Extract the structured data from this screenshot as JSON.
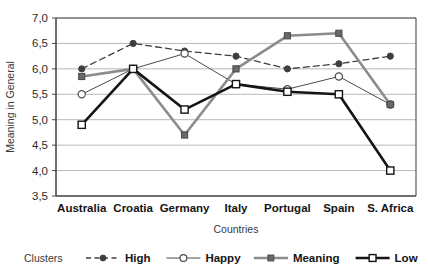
{
  "chart_data": {
    "type": "line",
    "title": "",
    "xlabel": "Countries",
    "ylabel": "Meaning in General",
    "categories": [
      "Australia",
      "Croatia",
      "Germany",
      "Italy",
      "Portugal",
      "Spain",
      "S. Africa"
    ],
    "ylim": [
      3.5,
      7.0
    ],
    "ytick_step": 0.5,
    "ytick_labels": [
      "7,0",
      "6,5",
      "6,0",
      "5,5",
      "5,0",
      "4,5",
      "4,0",
      "3,5"
    ],
    "ytick_values": [
      7.0,
      6.5,
      6.0,
      5.5,
      5.0,
      4.5,
      4.0,
      3.5
    ],
    "grid": true,
    "grid_axis": "y",
    "legend_position": "bottom",
    "legend_title": "Clusters",
    "series": [
      {
        "name": "High",
        "values": [
          6.0,
          6.5,
          6.35,
          6.25,
          6.0,
          6.1,
          6.25
        ],
        "marker": "filled-circle",
        "line_style": "dashed",
        "color": "#3f3f3f",
        "line_width": 1.3
      },
      {
        "name": "Happy",
        "values": [
          5.5,
          6.0,
          6.3,
          5.7,
          5.6,
          5.85,
          5.3
        ],
        "marker": "open-circle",
        "line_style": "solid",
        "color": "#4a4a4a",
        "line_width": 1.0
      },
      {
        "name": "Meaning",
        "values": [
          5.85,
          6.0,
          4.7,
          6.0,
          6.65,
          6.7,
          5.3
        ],
        "marker": "filled-square",
        "line_style": "solid",
        "color": "#8c8c8c",
        "line_width": 2.6
      },
      {
        "name": "Low",
        "values": [
          4.9,
          6.0,
          5.2,
          5.7,
          5.55,
          5.5,
          4.0
        ],
        "marker": "open-square",
        "line_style": "solid",
        "color": "#151515",
        "line_width": 2.6
      }
    ]
  },
  "colors": {
    "grid": "#b8b8b8",
    "axis": "#4a4a4a",
    "plot_background": "#ffffff",
    "page_background": "#ffffff"
  }
}
